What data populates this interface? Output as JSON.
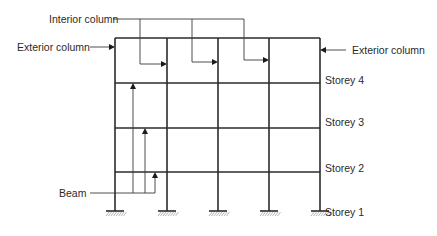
{
  "figure": {
    "type": "multi-storey frame elevation",
    "labels": {
      "interior_column": "Interior column",
      "exterior_column_left": "Exterior column",
      "exterior_column_right": "Exterior column",
      "beam": "Beam"
    },
    "storeys": [
      {
        "label": "Storey 4"
      },
      {
        "label": "Storey 3"
      },
      {
        "label": "Storey 2"
      },
      {
        "label": "Storey 1"
      }
    ],
    "bays": 4,
    "columns": 5,
    "supports": "fixed",
    "colors": {
      "line": "#2b2b2b",
      "text": "#2a2a2a",
      "hatch": "#9a9a9a"
    }
  }
}
